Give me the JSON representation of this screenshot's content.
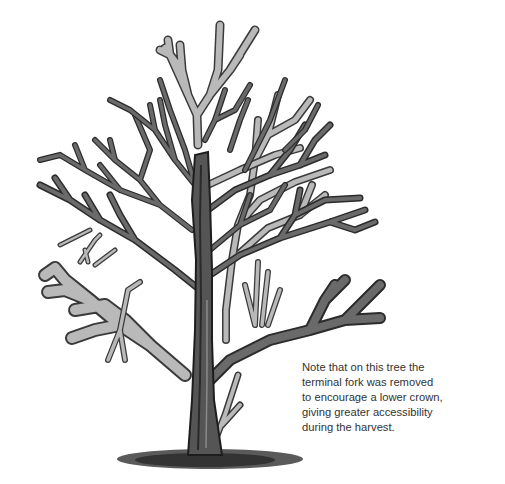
{
  "illustration": {
    "subject": "pruned tree",
    "colors": {
      "live_branch": "#2b2b2b",
      "live_branch_fill": "#6a6a6a",
      "removed_branch_outline": "#3a3a3a",
      "removed_branch_fill": "#b9b9b9",
      "ground": "#4a4a4a",
      "background": "#ffffff"
    },
    "legend_meaning": {
      "dark_branches": "retained",
      "grey_branches": "removed"
    }
  },
  "caption": {
    "lines": [
      "Note that on this tree the",
      "terminal fork was removed",
      "to encourage a lower crown,",
      "giving greater accessibility",
      "during the harvest."
    ]
  }
}
